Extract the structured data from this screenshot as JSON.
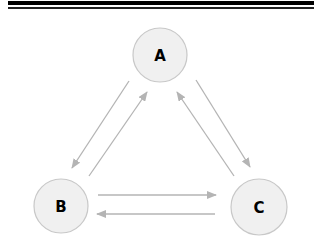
{
  "diagram": {
    "type": "directed-graph",
    "colors": {
      "node_fill": "#f0f0f0",
      "node_stroke": "#c8c8c8",
      "edge": "#b4b4b4",
      "label": "#000000",
      "header_bar": "#000000"
    },
    "nodes": [
      {
        "id": "A",
        "label": "A",
        "cx": 160,
        "cy": 55,
        "r": 27
      },
      {
        "id": "B",
        "label": "B",
        "cx": 61,
        "cy": 206,
        "r": 27
      },
      {
        "id": "C",
        "label": "C",
        "cx": 259,
        "cy": 207,
        "r": 28
      }
    ],
    "edges": [
      {
        "from": "A",
        "to": "B",
        "x1": 129,
        "y1": 81,
        "x2": 72,
        "y2": 168
      },
      {
        "from": "B",
        "to": "A",
        "x1": 89,
        "y1": 176,
        "x2": 147,
        "y2": 92
      },
      {
        "from": "A",
        "to": "C",
        "x1": 196,
        "y1": 80,
        "x2": 250,
        "y2": 167
      },
      {
        "from": "C",
        "to": "A",
        "x1": 234,
        "y1": 176,
        "x2": 177,
        "y2": 92
      },
      {
        "from": "B",
        "to": "C",
        "x1": 98,
        "y1": 195,
        "x2": 216,
        "y2": 195
      },
      {
        "from": "C",
        "to": "B",
        "x1": 215,
        "y1": 214,
        "x2": 97,
        "y2": 214
      }
    ]
  }
}
